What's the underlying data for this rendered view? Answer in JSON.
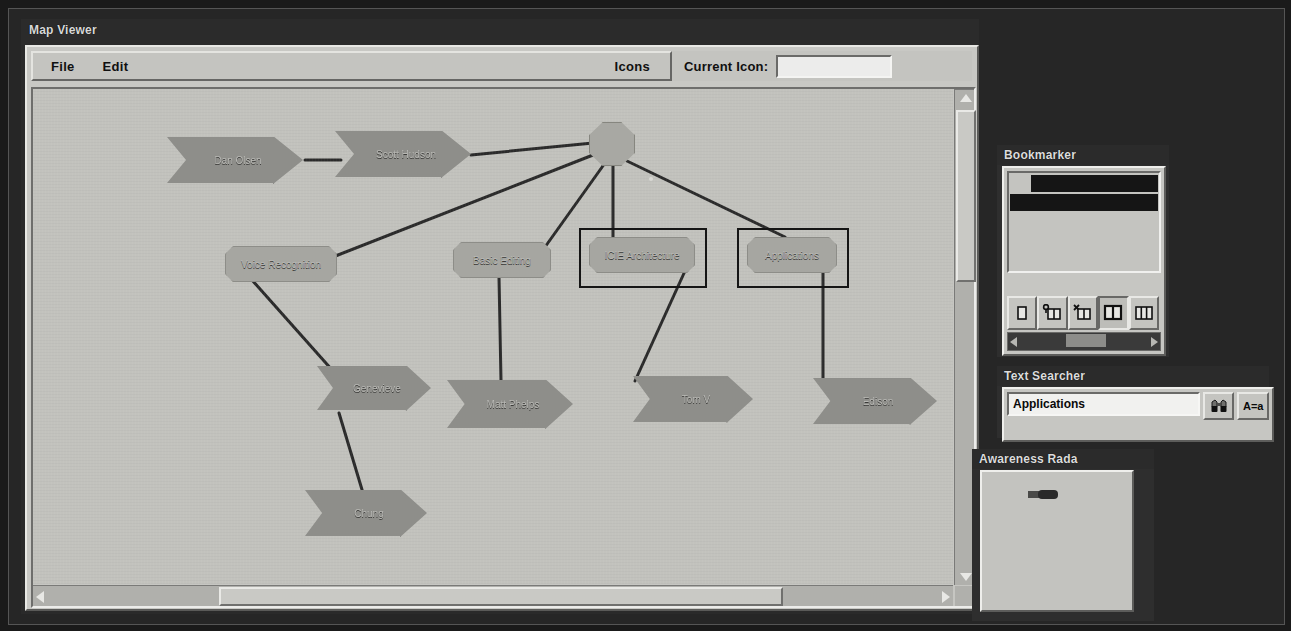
{
  "window": {
    "title": "Map Viewer"
  },
  "menu": {
    "file": "File",
    "edit": "Edit",
    "icons": "Icons",
    "current_icon_label": "Current Icon:",
    "current_icon_value": "",
    "current_icon_placeholder": ""
  },
  "map": {
    "nodes": [
      {
        "id": "dan-olsen",
        "label": "Dan Olsen",
        "shape": "arrow",
        "x": 134,
        "y": 48,
        "w": 136,
        "h": 46
      },
      {
        "id": "scott-hudson",
        "label": "Scott Hudson",
        "shape": "arrow",
        "x": 302,
        "y": 42,
        "w": 136,
        "h": 46
      },
      {
        "id": "hub",
        "label": "",
        "shape": "octagon",
        "x": 556,
        "y": 33,
        "w": 44,
        "h": 42
      },
      {
        "id": "voice-recognition",
        "label": "Voice Recognition",
        "shape": "round",
        "x": 192,
        "y": 157,
        "w": 110,
        "h": 34
      },
      {
        "id": "basic-editing",
        "label": "Basic Editing",
        "shape": "round",
        "x": 420,
        "y": 153,
        "w": 96,
        "h": 34
      },
      {
        "id": "icie-architecture",
        "label": "ICIE Architecture",
        "shape": "round",
        "x": 556,
        "y": 148,
        "w": 104,
        "h": 34,
        "selected": true
      },
      {
        "id": "applications",
        "label": "Applications",
        "shape": "round",
        "x": 714,
        "y": 148,
        "w": 88,
        "h": 34,
        "selected": true
      },
      {
        "id": "genevieve",
        "label": "Genevieve",
        "shape": "arrow",
        "x": 284,
        "y": 277,
        "w": 114,
        "h": 44
      },
      {
        "id": "matt-phelps",
        "label": "Matt Phelps",
        "shape": "arrow",
        "x": 414,
        "y": 291,
        "w": 126,
        "h": 48
      },
      {
        "id": "tom-v",
        "label": "Tom V",
        "shape": "arrow",
        "x": 600,
        "y": 287,
        "w": 120,
        "h": 46
      },
      {
        "id": "edison",
        "label": "Edison",
        "shape": "arrow",
        "x": 780,
        "y": 289,
        "w": 124,
        "h": 46
      },
      {
        "id": "chung",
        "label": "Chung",
        "shape": "arrow",
        "x": 272,
        "y": 401,
        "w": 122,
        "h": 46
      }
    ],
    "edges": [
      {
        "from": "dan-olsen",
        "to": "scott-hudson"
      },
      {
        "from": "scott-hudson",
        "to": "hub"
      },
      {
        "from": "hub",
        "to": "voice-recognition"
      },
      {
        "from": "hub",
        "to": "basic-editing"
      },
      {
        "from": "hub",
        "to": "icie-architecture"
      },
      {
        "from": "hub",
        "to": "applications"
      },
      {
        "from": "voice-recognition",
        "to": "genevieve"
      },
      {
        "from": "basic-editing",
        "to": "matt-phelps"
      },
      {
        "from": "icie-architecture",
        "to": "tom-v"
      },
      {
        "from": "applications",
        "to": "edison"
      },
      {
        "from": "genevieve",
        "to": "chung"
      }
    ],
    "scrollbars": {
      "vertical_thumb_pct": 34,
      "horizontal_thumb_pct": 61
    }
  },
  "bookmarker": {
    "title": "Bookmarker",
    "rows": [
      {
        "label": "",
        "indented": true
      },
      {
        "label": "",
        "indented": false
      }
    ],
    "tools": [
      {
        "name": "single-pane-icon",
        "active": false
      },
      {
        "name": "add-pane-icon",
        "active": false
      },
      {
        "name": "remove-pane-icon",
        "active": false
      },
      {
        "name": "split-pane-icon",
        "active": true
      },
      {
        "name": "three-pane-icon",
        "active": false
      }
    ]
  },
  "text_searcher": {
    "title": "Text Searcher",
    "query": "Applications",
    "placeholder": "",
    "find_button": "binoculars-icon",
    "case_button": "A=a"
  },
  "awareness_radar": {
    "title": "Awareness Rada"
  },
  "colors": {
    "desktop": "#1a1a1a",
    "window_chrome": "#c4c4c0",
    "canvas": "#c2c2bd",
    "node_fill": "#8e8e8a",
    "panel_title_bg": "#2b2b2b",
    "selection": "#151515"
  }
}
